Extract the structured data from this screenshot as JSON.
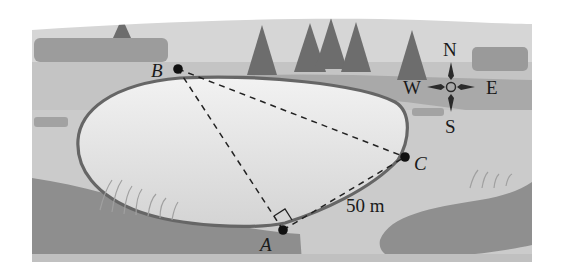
{
  "figure": {
    "points": {
      "A": {
        "label": "A",
        "x": 283,
        "y": 230
      },
      "B": {
        "label": "B",
        "x": 178,
        "y": 69
      },
      "C": {
        "label": "C",
        "x": 405,
        "y": 157
      }
    },
    "segments": [
      {
        "from": "A",
        "to": "B",
        "style": "dashed"
      },
      {
        "from": "B",
        "to": "C",
        "style": "dashed"
      },
      {
        "from": "A",
        "to": "C",
        "style": "dashed"
      }
    ],
    "right_angle_at": "A",
    "measurement": {
      "segment": "AC",
      "label": "50 m"
    },
    "compass": {
      "north": "N",
      "south": "S",
      "east": "E",
      "west": "W"
    }
  },
  "colors": {
    "background": "#ffffff",
    "sky": "#d9d9d9",
    "far_ground": "#bdbdbd",
    "mid_band": "#a8a8a8",
    "near_ground": "#c9c9c9",
    "pond_water": "#e8e8e8",
    "pond_edge": "#6a6a6a",
    "dark_mound": "#8f8f8f",
    "trees": "#6e6e6e",
    "hedges": "#9a9a9a",
    "ink": "#1a1a1a"
  }
}
